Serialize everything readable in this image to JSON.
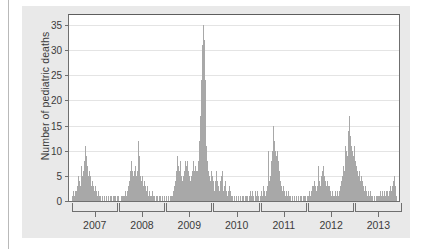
{
  "chart_data": {
    "type": "bar",
    "title": "",
    "subtitle": "",
    "xlabel": "",
    "ylabel": "Number of pediatric deaths",
    "ylim": [
      0,
      37
    ],
    "yticks": [
      0,
      5,
      10,
      15,
      20,
      25,
      30,
      35
    ],
    "ytick_labels": [
      "0",
      "5",
      "10",
      "15",
      "20",
      "25",
      "30",
      "35"
    ],
    "grid": true,
    "legend": "none",
    "x_axis_type": "influenza-season-brackets",
    "xtick_labels": [
      "2007",
      "2008",
      "2009",
      "2010",
      "2011",
      "2012",
      "2013"
    ],
    "seasons": [
      {
        "label": "2007",
        "start_index": 4,
        "end_index": 55
      },
      {
        "label": "2008",
        "start_index": 57,
        "end_index": 108
      },
      {
        "label": "2009",
        "start_index": 110,
        "end_index": 161
      },
      {
        "label": "2010",
        "start_index": 163,
        "end_index": 214
      },
      {
        "label": "2011",
        "start_index": 216,
        "end_index": 267
      },
      {
        "label": "2012",
        "start_index": 269,
        "end_index": 320
      },
      {
        "label": "2013",
        "start_index": 322,
        "end_index": 373
      }
    ],
    "series_name": "Weekly pediatric influenza deaths",
    "bar_color": "#a8a8a8",
    "n_points": 376,
    "peaks": [
      {
        "season": "2006-07",
        "value": 11
      },
      {
        "season": "2007-08",
        "value": 12
      },
      {
        "season": "2008-09",
        "value": 9
      },
      {
        "season": "2009 H1N1 pandemic",
        "value": 35
      },
      {
        "season": "2010-11",
        "value": 15
      },
      {
        "season": "2011-12",
        "value": 7
      },
      {
        "season": "2012-13",
        "value": 17
      }
    ],
    "values": [
      0,
      0,
      0,
      1,
      1,
      2,
      1,
      2,
      2,
      3,
      5,
      4,
      3,
      5,
      7,
      5,
      6,
      8,
      11,
      9,
      7,
      5,
      6,
      4,
      5,
      3,
      4,
      3,
      2,
      3,
      2,
      1,
      2,
      1,
      1,
      1,
      0,
      1,
      0,
      1,
      0,
      1,
      1,
      0,
      1,
      0,
      1,
      1,
      0,
      1,
      0,
      1,
      1,
      0,
      1,
      1,
      0,
      0,
      1,
      1,
      0,
      1,
      1,
      2,
      1,
      2,
      3,
      4,
      6,
      8,
      7,
      6,
      5,
      6,
      7,
      5,
      6,
      12,
      9,
      6,
      5,
      4,
      5,
      3,
      4,
      3,
      2,
      3,
      2,
      1,
      2,
      1,
      1,
      2,
      1,
      1,
      0,
      1,
      0,
      1,
      0,
      1,
      1,
      0,
      1,
      0,
      1,
      1,
      0,
      1,
      0,
      1,
      0,
      1,
      1,
      0,
      1,
      2,
      3,
      4,
      6,
      9,
      7,
      6,
      8,
      6,
      5,
      4,
      5,
      6,
      8,
      7,
      8,
      6,
      5,
      3,
      4,
      5,
      6,
      8,
      6,
      7,
      6,
      5,
      6,
      8,
      12,
      17,
      24,
      31,
      35,
      32,
      24,
      16,
      11,
      8,
      6,
      5,
      4,
      6,
      5,
      4,
      3,
      2,
      4,
      6,
      4,
      3,
      2,
      4,
      5,
      6,
      3,
      2,
      3,
      4,
      2,
      1,
      2,
      3,
      1,
      2,
      1,
      1,
      0,
      1,
      0,
      1,
      0,
      1,
      1,
      0,
      1,
      0,
      1,
      1,
      0,
      1,
      0,
      1,
      1,
      0,
      1,
      2,
      1,
      2,
      1,
      0,
      1,
      2,
      1,
      2,
      1,
      0,
      1,
      2,
      1,
      2,
      3,
      2,
      1,
      2,
      3,
      10,
      4,
      5,
      6,
      8,
      10,
      15,
      12,
      10,
      9,
      10,
      8,
      6,
      5,
      4,
      3,
      2,
      3,
      2,
      1,
      2,
      1,
      1,
      2,
      1,
      1,
      0,
      1,
      0,
      1,
      0,
      1,
      1,
      0,
      1,
      0,
      1,
      1,
      0,
      1,
      0,
      1,
      1,
      0,
      1,
      1,
      2,
      1,
      2,
      3,
      2,
      3,
      4,
      3,
      2,
      3,
      7,
      4,
      3,
      4,
      5,
      6,
      7,
      5,
      4,
      3,
      4,
      3,
      2,
      3,
      2,
      1,
      2,
      1,
      1,
      2,
      1,
      1,
      2,
      1,
      2,
      3,
      4,
      5,
      7,
      6,
      8,
      11,
      10,
      9,
      14,
      17,
      13,
      11,
      10,
      9,
      11,
      9,
      8,
      7,
      6,
      5,
      6,
      4,
      5,
      3,
      4,
      3,
      2,
      3,
      2,
      1,
      2,
      1,
      1,
      2,
      1,
      1,
      0,
      1,
      0,
      1,
      1,
      0,
      1,
      1,
      2,
      1,
      2,
      1,
      2,
      1,
      2,
      1,
      2,
      1,
      2,
      3,
      2,
      3,
      4,
      5,
      3,
      2,
      1,
      0,
      0
    ]
  }
}
